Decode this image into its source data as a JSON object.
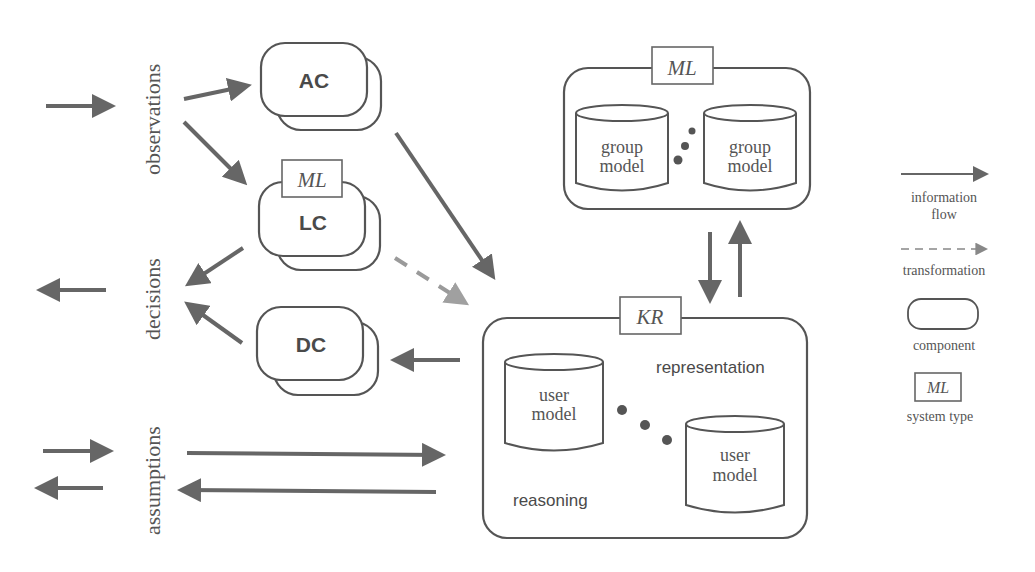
{
  "side_labels": {
    "observations": "observations",
    "decisions": "decisions",
    "assumptions": "assumptions"
  },
  "components": {
    "ac": {
      "label": "AC"
    },
    "lc": {
      "label": "LC",
      "system_type": "ML"
    },
    "dc": {
      "label": "DC"
    }
  },
  "group_system": {
    "system_type": "ML",
    "models": [
      {
        "line1": "group",
        "line2": "model"
      },
      {
        "line1": "group",
        "line2": "model"
      }
    ]
  },
  "kr_system": {
    "system_type": "KR",
    "representation_label": "representation",
    "reasoning_label": "reasoning",
    "models": [
      {
        "line1": "user",
        "line2": "model"
      },
      {
        "line1": "user",
        "line2": "model"
      }
    ]
  },
  "legend": {
    "information_flow": {
      "line1": "information",
      "line2": "flow"
    },
    "transformation": "transformation",
    "component": "component",
    "system_type": {
      "tag": "ML",
      "label": "system type"
    }
  },
  "colors": {
    "arrow": "#666666",
    "dashed_arrow": "#9a9a9a",
    "outline": "#555555",
    "text": "#555555"
  }
}
